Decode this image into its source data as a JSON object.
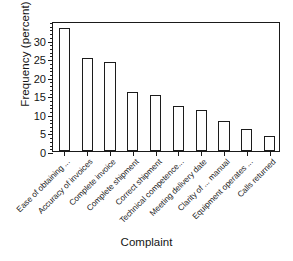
{
  "chart_data": {
    "type": "bar",
    "title": "",
    "xlabel": "Complaint",
    "ylabel": "Frequency (percent)",
    "categories": [
      "Ease of obtaining ...",
      "Accuracy of invoices",
      "Complete invoice",
      "Complete shipment",
      "Correct shipment",
      "Technical competence...",
      "Meeting delivery date",
      "Clarity of ... manual",
      "Equipment operates ...",
      "Calls returned"
    ],
    "values": [
      33,
      25,
      24,
      16,
      15,
      12,
      11,
      8,
      6,
      4
    ],
    "ylim": [
      0,
      35
    ],
    "yticks": [
      0,
      5,
      10,
      15,
      20,
      25,
      30
    ],
    "ytick_labels": [
      "0",
      "5",
      "10",
      "15",
      "20",
      "25",
      "30"
    ],
    "yminor_step": 1,
    "grid": false,
    "legend": false,
    "bar_facecolor": "#ffffff",
    "bar_edgecolor": "#1c1c1c",
    "axis_color": "#1a1a1a",
    "background": "#ffffff"
  }
}
